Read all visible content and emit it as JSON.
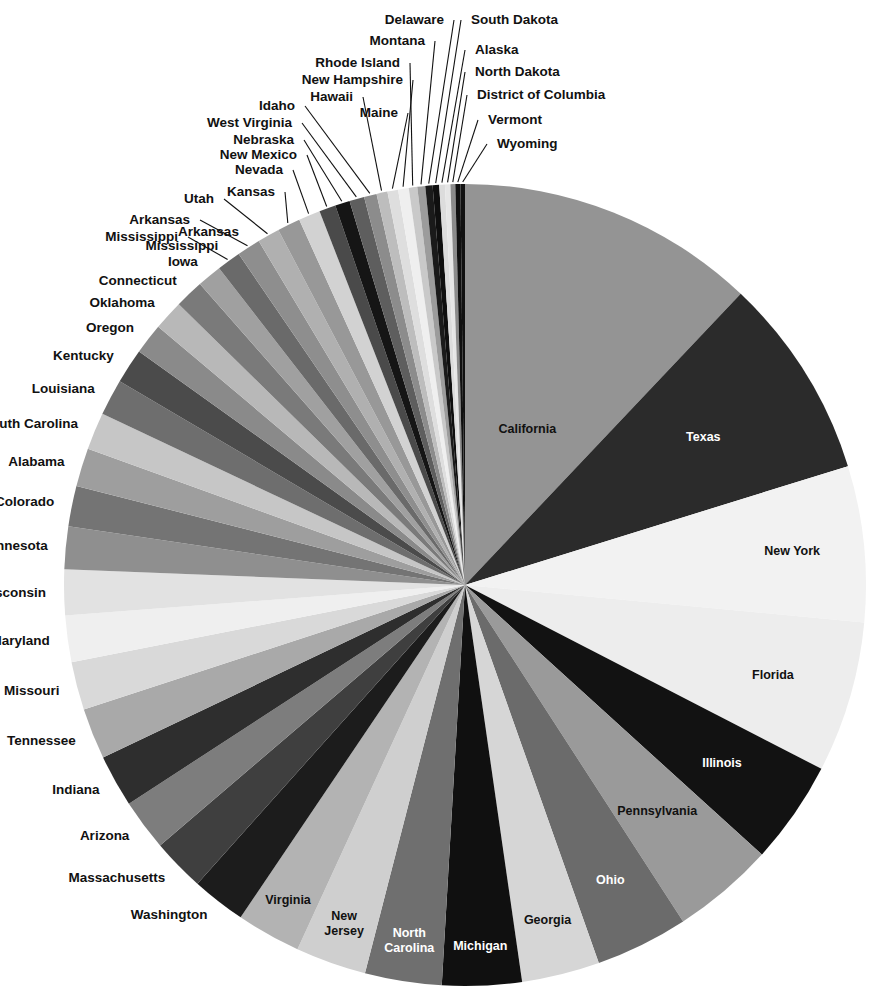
{
  "chart_data": {
    "type": "pie",
    "title": "",
    "subtitle": "",
    "xlabel": "",
    "ylabel": "",
    "legend_position": "none",
    "grid": false,
    "start_angle_deg": 0,
    "direction": "clockwise",
    "center": {
      "cx": 465,
      "cy": 585,
      "r": 401
    },
    "label_text_color_light": "#ffffff",
    "label_text_color_dark": "#111111",
    "categories": [
      "California",
      "Texas",
      "New York",
      "Florida",
      "Illinois",
      "Pennsylvania",
      "Ohio",
      "Georgia",
      "Michigan",
      "North Carolina",
      "New Jersey",
      "Virginia",
      "Washington",
      "Massachusetts",
      "Arizona",
      "Indiana",
      "Tennessee",
      "Missouri",
      "Maryland",
      "Wisconsin",
      "Minnesota",
      "Colorado",
      "Alabama",
      "South Carolina",
      "Louisiana",
      "Kentucky",
      "Oregon",
      "Oklahoma",
      "Connecticut",
      "Iowa",
      "Mississippi",
      "Arkansas",
      "Utah",
      "Kansas",
      "Nevada",
      "New Mexico",
      "Nebraska",
      "West Virginia",
      "Idaho",
      "Hawaii",
      "Maine",
      "New Hampshire",
      "Rhode Island",
      "Montana",
      "Delaware",
      "South Dakota",
      "Alaska",
      "North Dakota",
      "District of Columbia",
      "Vermont",
      "Wyoming"
    ],
    "values": [
      37.25,
      25.15,
      19.38,
      18.8,
      12.83,
      12.7,
      11.54,
      9.69,
      9.88,
      9.54,
      8.79,
      8.0,
      6.72,
      6.55,
      6.39,
      6.48,
      6.35,
      5.99,
      5.77,
      5.69,
      5.3,
      5.03,
      4.78,
      4.63,
      4.53,
      4.34,
      3.83,
      3.75,
      3.57,
      3.05,
      2.97,
      2.92,
      2.76,
      2.85,
      2.7,
      2.06,
      1.83,
      1.85,
      1.57,
      1.36,
      1.33,
      1.32,
      1.05,
      0.99,
      0.9,
      0.81,
      0.71,
      0.67,
      0.6,
      0.63,
      0.56
    ],
    "colors": [
      "#949494",
      "#2b2b2b",
      "#f2f2f2",
      "#ededed",
      "#121212",
      "#9a9a9a",
      "#6b6b6b",
      "#d6d6d6",
      "#101010",
      "#6f6f6f",
      "#cfcfcf",
      "#b3b3b3",
      "#1c1c1c",
      "#3f3f3f",
      "#7d7d7d",
      "#2e2e2e",
      "#a9a9a9",
      "#d9d9d9",
      "#efefef",
      "#e2e2e2",
      "#8f8f8f",
      "#747474",
      "#9e9e9e",
      "#c6c6c6",
      "#6e6e6e",
      "#4b4b4b",
      "#8a8a8a",
      "#b8b8b8",
      "#7a7a7a",
      "#a0a0a0",
      "#6a6a6a",
      "#8e8e8e",
      "#b0b0b0",
      "#989898",
      "#d2d2d2",
      "#4a4a4a",
      "#151515",
      "#5e5e5e",
      "#8c8c8c",
      "#bdbdbd",
      "#dedede",
      "#efefef",
      "#c9c9c9",
      "#9c9c9c",
      "#1a1a1a",
      "#0f0f0f",
      "#dcdcdc",
      "#e6e6e6",
      "#8b8b8b",
      "#101010",
      "#111111"
    ],
    "inside_labeled": [
      "California",
      "Texas",
      "New York",
      "Florida",
      "Illinois",
      "Pennsylvania",
      "Ohio",
      "Georgia",
      "Michigan",
      "North Carolina",
      "New Jersey",
      "Virginia",
      "Washington",
      "Massachusetts",
      "Arizona",
      "Indiana",
      "Tennessee",
      "Missouri",
      "Maryland",
      "Wisconsin",
      "Minnesota",
      "Colorado",
      "Alabama",
      "South Carolina",
      "Louisiana",
      "Kentucky",
      "Oregon",
      "Oklahoma",
      "Connecticut",
      "Iowa",
      "Mississippi",
      "Arkansas"
    ],
    "leader_labeled": [
      "Utah",
      "Kansas",
      "Nevada",
      "New Mexico",
      "Nebraska",
      "West Virginia",
      "Idaho",
      "Hawaii",
      "Maine",
      "New Hampshire",
      "Rhode Island",
      "Montana",
      "Delaware",
      "South Dakota",
      "Alaska",
      "North Dakota",
      "District of Columbia",
      "Vermont",
      "Wyoming"
    ]
  },
  "labels": {
    "california": "California",
    "texas": "Texas",
    "new_york": "New York",
    "florida": "Florida",
    "illinois": "Illinois",
    "pennsylvania": "Pennsylvania",
    "ohio": "Ohio",
    "georgia": "Georgia",
    "michigan": "Michigan",
    "north_carolina_1": "North",
    "north_carolina_2": "Carolina",
    "new_jersey_1": "New",
    "new_jersey_2": "Jersey",
    "virginia": "Virginia",
    "washington": "Washington",
    "massachusetts": "Massachusetts",
    "arizona": "Arizona",
    "indiana": "Indiana",
    "tennessee": "Tennessee",
    "missouri": "Missouri",
    "maryland": "Maryland",
    "wisconsin": "Wisconsin",
    "minnesota": "Minnesota",
    "colorado": "Colorado",
    "alabama": "Alabama",
    "south_carolina": "South Carolina",
    "louisiana": "Louisiana",
    "kentucky": "Kentucky",
    "oregon": "Oregon",
    "oklahoma": "Oklahoma",
    "connecticut": "Connecticut",
    "iowa": "Iowa",
    "mississippi": "Mississippi",
    "arkansas": "Arkansas",
    "utah": "Utah",
    "kansas": "Kansas",
    "nevada": "Nevada",
    "new_mexico": "New Mexico",
    "nebraska": "Nebraska",
    "west_virginia": "West Virginia",
    "idaho": "Idaho",
    "hawaii": "Hawaii",
    "maine": "Maine",
    "new_hampshire": "New Hampshire",
    "rhode_island": "Rhode Island",
    "montana": "Montana",
    "delaware": "Delaware",
    "south_dakota": "South Dakota",
    "alaska": "Alaska",
    "north_dakota": "North Dakota",
    "district_of_columbia": "District of Columbia",
    "vermont": "Vermont",
    "wyoming": "Wyoming"
  }
}
